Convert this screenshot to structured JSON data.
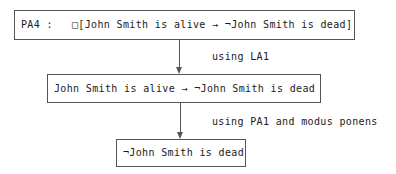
{
  "diagram": {
    "background_color": "#ffffff",
    "stroke_color": "#555555",
    "text_color": "#1a1a1a",
    "nodes": [
      {
        "id": "premise",
        "label": "PA4 :   □[John Smith is alive → ¬John Smith is dead]"
      },
      {
        "id": "intermediate",
        "label": "John Smith is alive → ¬John Smith is dead"
      },
      {
        "id": "conclusion",
        "label": "¬John Smith is dead"
      }
    ],
    "edges": [
      {
        "id": "edge-1",
        "from": "premise",
        "to": "intermediate",
        "label": "using LA1"
      },
      {
        "id": "edge-2",
        "from": "intermediate",
        "to": "conclusion",
        "label": "using PA1 and modus ponens"
      }
    ]
  }
}
